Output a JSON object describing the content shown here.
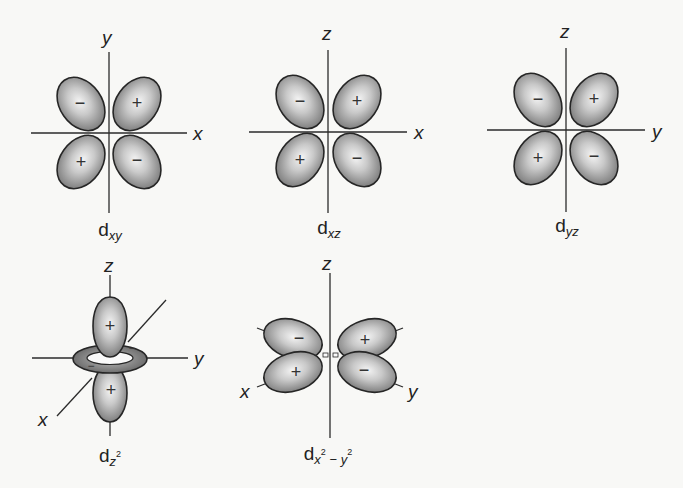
{
  "diagram": {
    "colors": {
      "background": "#f8f8f6",
      "lobe_center": "#f2f2f2",
      "lobe_edge": "#858585",
      "outline": "#262626"
    },
    "orbitals": [
      {
        "id": "dxy",
        "label_main": "d",
        "label_sub": "xy",
        "vertical_axis": "y",
        "horizontal_axis": "x",
        "signs": {
          "upper_left": "−",
          "upper_right": "+",
          "lower_left": "+",
          "lower_right": "−"
        }
      },
      {
        "id": "dxz",
        "label_main": "d",
        "label_sub": "xz",
        "vertical_axis": "z",
        "horizontal_axis": "x",
        "signs": {
          "upper_left": "−",
          "upper_right": "+",
          "lower_left": "+",
          "lower_right": "−"
        }
      },
      {
        "id": "dyz",
        "label_main": "d",
        "label_sub": "yz",
        "vertical_axis": "z",
        "horizontal_axis": "y",
        "signs": {
          "upper_left": "−",
          "upper_right": "+",
          "lower_left": "+",
          "lower_right": "−"
        }
      },
      {
        "id": "dz2",
        "label_main": "d",
        "label_sub": "z",
        "label_sup": "2",
        "vertical_axis": "z",
        "horizontal_axis": "y",
        "diagonal_axis": "x",
        "signs": {
          "upper": "+",
          "lower": "+",
          "torus": "−"
        }
      },
      {
        "id": "dx2-y2",
        "label_main": "d",
        "label_sub_1": "x",
        "label_sup_1": "2",
        "label_sub_minus": " − ",
        "label_sub_2": "y",
        "label_sup_2": "2",
        "vertical_axis": "z",
        "left_axis": "x",
        "right_axis": "y",
        "signs": {
          "upper_left": "−",
          "upper_right": "+",
          "lower_left": "+",
          "lower_right": "−"
        }
      }
    ]
  }
}
